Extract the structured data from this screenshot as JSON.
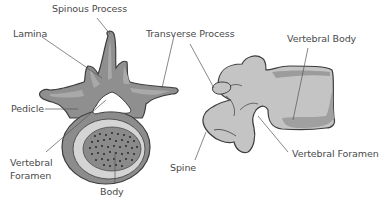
{
  "colors": {
    "bone_dark": "#8c8c8c",
    "bone_mid": "#a6a6a6",
    "bone_light": "#d4d4d4",
    "side_bone": "#c4c4c4",
    "shade": "#9a9a9a",
    "outline": "#3c3c3c",
    "leader": "#555555",
    "text": "#4a4a4a"
  },
  "top_view": {
    "labels": {
      "spinous_process": "Spinous Process",
      "lamina": "Lamina",
      "transverse_process": "Transverse Process",
      "pedicle": "Pedicle",
      "vertebral_foramen_1": "Vertebral",
      "vertebral_foramen_2": "Foramen",
      "body": "Body"
    }
  },
  "side_view": {
    "labels": {
      "vertebral_body": "Vertebral Body",
      "spine": "Spine",
      "vertebral_foramen": "Vertebral Foramen"
    }
  }
}
